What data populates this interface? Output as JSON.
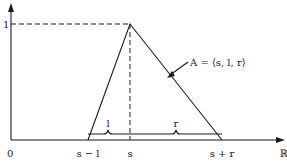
{
  "diagram": {
    "type": "triangular-fuzzy-number",
    "y_axis_tick_label": "1",
    "x_axis": {
      "origin_label": "0",
      "end_label": "ℝ",
      "tick_labels": [
        "s − l",
        "s",
        "s + r"
      ]
    },
    "brace_labels": {
      "left": "l",
      "right": "r"
    },
    "curve_label": "A = ⟨s, l, r⟩"
  }
}
